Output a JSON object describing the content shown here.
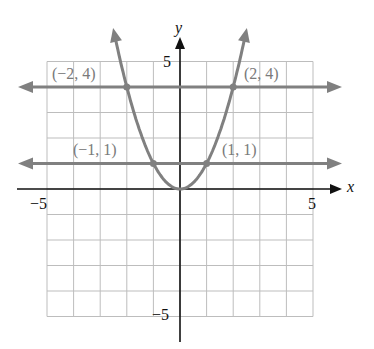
{
  "chart_data": {
    "type": "line",
    "title": "",
    "xlabel": "x",
    "ylabel": "y",
    "xlim": [
      -5,
      5
    ],
    "ylim": [
      -5,
      5
    ],
    "grid": true,
    "tick_labels": {
      "x_min": "−5",
      "x_max": "5",
      "y_max": "5",
      "y_min": "−5"
    },
    "series": [
      {
        "name": "y = x^2",
        "kind": "parabola",
        "x": [
          -2.5,
          -2,
          -1,
          0,
          1,
          2,
          2.5
        ],
        "y": [
          6.25,
          4,
          1,
          0,
          1,
          4,
          6.25
        ]
      },
      {
        "name": "y = 4",
        "kind": "horizontal-line",
        "y": 4
      },
      {
        "name": "y = 1",
        "kind": "horizontal-line",
        "y": 1
      }
    ],
    "points": [
      {
        "x": -2,
        "y": 4,
        "label": "(−2, 4)"
      },
      {
        "x": 2,
        "y": 4,
        "label": "(2, 4)"
      },
      {
        "x": -1,
        "y": 1,
        "label": "(−1, 1)"
      },
      {
        "x": 1,
        "y": 1,
        "label": "(1, 1)"
      }
    ],
    "colors": {
      "curve": "#808080",
      "axis": "#111111",
      "grid": "#bdbdbd"
    }
  }
}
